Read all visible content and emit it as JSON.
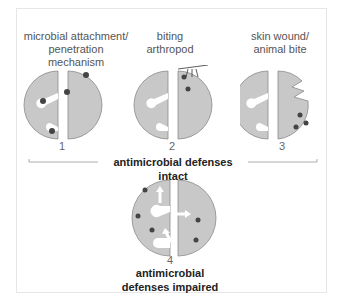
{
  "panels": [
    {
      "number": "1",
      "label_line1": "microbial attachment/",
      "label_line2": "penetration mechanism"
    },
    {
      "number": "2",
      "label_line1": "biting",
      "label_line2": "arthropod"
    },
    {
      "number": "3",
      "label_line1": "skin wound/",
      "label_line2": "animal bite"
    },
    {
      "number": "4",
      "label_line1": "antimicrobial",
      "label_line2": "defenses impaired"
    }
  ],
  "bracket_label": "antimicrobial defenses intact",
  "colors": {
    "cell": "#c8c8c8",
    "outline": "#8a8a8a",
    "microbe": "#444444",
    "border": "#e6e6e6"
  }
}
